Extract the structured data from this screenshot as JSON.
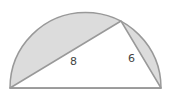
{
  "figure": {
    "labels": {
      "leg_long": "8",
      "leg_short": "6"
    },
    "colors": {
      "shade": "#dcdcdc",
      "stroke": "#999999",
      "background": "#ffffff"
    }
  }
}
